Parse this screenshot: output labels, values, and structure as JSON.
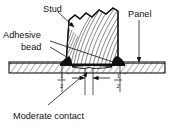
{
  "figure": {
    "type": "technical-cross-section",
    "background_color": "#ffffff",
    "line_color": "#111111"
  },
  "labels": {
    "stud": "Stud",
    "panel": "Panel",
    "adhesive_line1": "Adhesive",
    "adhesive_line2": "bead",
    "moderate_contact": "Moderate contact"
  },
  "dimensions": {
    "left": {
      "numerator": "1",
      "denominator": "2",
      "unit": "\""
    },
    "right": {
      "numerator": "1",
      "denominator": "2",
      "unit": "\""
    }
  },
  "parts": {
    "stud_fill": "#ffffff",
    "panel_fill": "#ffffff",
    "adhesive_fill": "#111111",
    "grain_color": "#222222",
    "hatch_color": "#333333"
  }
}
